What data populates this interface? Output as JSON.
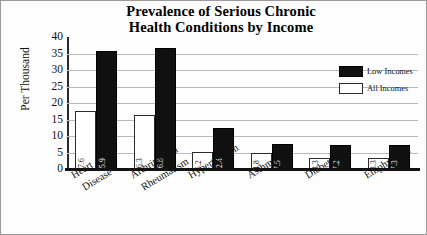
{
  "chart_data": {
    "type": "bar",
    "title": "Prevalence of Serious Chronic Health Conditions by Income",
    "title_line1": "Prevalence of Serious Chronic",
    "title_line2": "Health Conditions by Income",
    "xlabel": "",
    "ylabel": "Per Thousand",
    "ylim": [
      0,
      40
    ],
    "ytick_step": 5,
    "yticks": [
      "40",
      "35",
      "30",
      "25",
      "20",
      "15",
      "10",
      "5",
      "0"
    ],
    "grid": true,
    "legend_position": "right-inside",
    "categories": [
      "Heart Disease",
      "Arthritis and Rheumatism",
      "Hypertension",
      "Asthma",
      "Diabetes",
      "Emphysema"
    ],
    "category_lines": [
      [
        "Heart",
        "Disease"
      ],
      [
        "Arthritis and",
        "Rheumatism"
      ],
      [
        "Hypertension",
        ""
      ],
      [
        "Asthma",
        ""
      ],
      [
        "Diabetes",
        ""
      ],
      [
        "Emphysema",
        ""
      ]
    ],
    "series": [
      {
        "name": "All Incomes",
        "color": "#ffffff",
        "values": [
          17.6,
          16.3,
          5.2,
          4.8,
          3.3,
          3.3
        ],
        "labels": [
          "17.6",
          "16.3",
          "5.2",
          "4.8",
          "3.3",
          "3.3"
        ]
      },
      {
        "name": "Low Incomes",
        "color": "#111111",
        "values": [
          35.9,
          36.8,
          12.4,
          7.5,
          7.2,
          7.3
        ],
        "labels": [
          "35.9",
          "36.8",
          "12.4",
          "7.5",
          "7.2",
          "7.3"
        ]
      }
    ]
  },
  "legend": {
    "items": [
      {
        "label": "Low Incomes",
        "swatch": "black-filled-swatch"
      },
      {
        "label": "All Incomes",
        "swatch": "white-outlined-swatch"
      }
    ]
  }
}
